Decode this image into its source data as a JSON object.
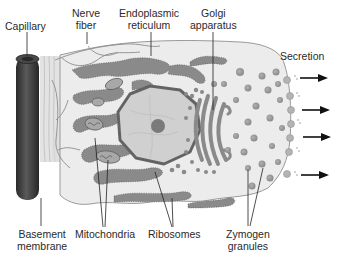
{
  "diagram": {
    "labels": {
      "capillary": [
        "Capillary"
      ],
      "nerve_fiber": [
        "Nerve",
        "fiber"
      ],
      "endoplasmic_reticulum": [
        "Endoplasmic",
        "reticulum"
      ],
      "golgi_apparatus": [
        "Golgi",
        "apparatus"
      ],
      "secretion": [
        "Secretion"
      ],
      "basement_membrane": [
        "Basement",
        "membrane"
      ],
      "mitochondria": [
        "Mitochondria"
      ],
      "ribosomes": [
        "Ribosomes"
      ],
      "zymogen_granules": [
        "Zymogen",
        "granules"
      ]
    },
    "secretion_arrows": 4,
    "colors": {
      "background": "#ffffff",
      "cytoplasm": "#ececec",
      "er": "#8a8a8a",
      "nucleus": "#cfcfcf",
      "nucleolus": "#777777",
      "capillary": "#3a3a3a",
      "granule": "#9a9a9a",
      "text": "#2a2a2a"
    }
  }
}
